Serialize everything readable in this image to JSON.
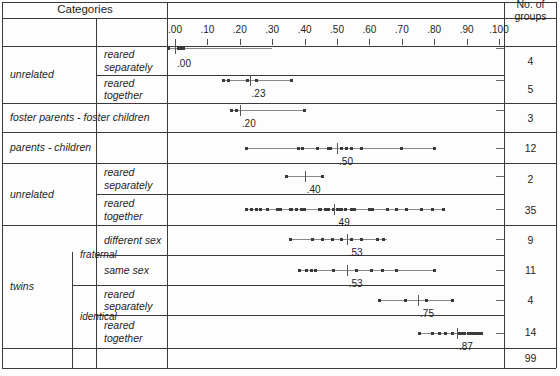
{
  "chart_data": {
    "type": "scatter",
    "title": "",
    "xlabel": "",
    "ylabel": "",
    "xlim": [
      -0.03,
      1.06
    ],
    "grid": false,
    "legend": null,
    "axis_ticks": [
      {
        "label": ".00",
        "value": 0.0
      },
      {
        "label": ".10",
        "value": 0.1
      },
      {
        "label": ".20",
        "value": 0.2
      },
      {
        "label": ".30",
        "value": 0.3
      },
      {
        "label": ".40",
        "value": 0.4
      },
      {
        "label": ".50",
        "value": 0.5
      },
      {
        "label": ".60",
        "value": 0.6
      },
      {
        "label": ".70",
        "value": 0.7
      },
      {
        "label": ".80",
        "value": 0.8
      },
      {
        "label": ".90",
        "value": 0.9
      },
      {
        "label": ".100",
        "value": 1.0
      }
    ],
    "rows": [
      {
        "category": "unrelated / reared separately",
        "groups": 4,
        "mean": 0.0,
        "mean_label": ".00",
        "range": [
          -0.02,
          0.3
        ],
        "values": [
          -0.02,
          0.01,
          0.02,
          0.025
        ]
      },
      {
        "category": "unrelated / reared together",
        "groups": 5,
        "mean": 0.23,
        "mean_label": ".23",
        "range": [
          0.15,
          0.36
        ],
        "values": [
          0.15,
          0.165,
          0.225,
          0.25,
          0.36
        ]
      },
      {
        "category": "foster parents - foster children",
        "groups": 3,
        "mean": 0.2,
        "mean_label": ".20",
        "range": [
          0.175,
          0.4
        ],
        "values": [
          0.175,
          0.19,
          0.4
        ]
      },
      {
        "category": "parents - children",
        "groups": 12,
        "mean": 0.5,
        "mean_label": ".50",
        "range": [
          0.22,
          0.8
        ],
        "values": [
          0.22,
          0.38,
          0.395,
          0.44,
          0.475,
          0.48,
          0.515,
          0.53,
          0.545,
          0.575,
          0.7,
          0.8
        ]
      },
      {
        "category": "unrelated / reared separately (2)",
        "groups": 2,
        "mean": 0.4,
        "mean_label": ".40",
        "range": [
          0.345,
          0.455
        ],
        "values": [
          0.345,
          0.455
        ]
      },
      {
        "category": "unrelated / reared together (2)",
        "groups": 35,
        "mean": 0.49,
        "mean_label": ".49",
        "range": [
          0.22,
          0.83
        ],
        "values": [
          0.22,
          0.235,
          0.25,
          0.265,
          0.285,
          0.315,
          0.325,
          0.355,
          0.36,
          0.36,
          0.36,
          0.375,
          0.39,
          0.4,
          0.445,
          0.45,
          0.45,
          0.465,
          0.475,
          0.49,
          0.5,
          0.505,
          0.515,
          0.515,
          0.525,
          0.545,
          0.555,
          0.6,
          0.61,
          0.655,
          0.685,
          0.715,
          0.76,
          0.795,
          0.83
        ]
      },
      {
        "category": "twins / fraternal / different sex",
        "groups": 9,
        "mean": 0.53,
        "mean_label": ".53",
        "range": [
          0.355,
          0.655
        ],
        "values": [
          0.355,
          0.425,
          0.455,
          0.485,
          0.515,
          0.545,
          0.575,
          0.625,
          0.645
        ]
      },
      {
        "category": "twins / fraternal / same sex",
        "groups": 11,
        "mean": 0.53,
        "mean_label": ".53",
        "range": [
          0.385,
          0.8
        ],
        "values": [
          0.385,
          0.405,
          0.42,
          0.435,
          0.49,
          0.49,
          0.56,
          0.605,
          0.64,
          0.685,
          0.8
        ]
      },
      {
        "category": "twins / identical / reared separately",
        "groups": 4,
        "mean": 0.75,
        "mean_label": ".75",
        "range": [
          0.63,
          0.855
        ],
        "values": [
          0.63,
          0.71,
          0.775,
          0.855
        ]
      },
      {
        "category": "twins / identical / reared together",
        "groups": 14,
        "mean": 0.87,
        "mean_label": ".87",
        "range": [
          0.755,
          0.945
        ],
        "values": [
          0.755,
          0.795,
          0.815,
          0.835,
          0.855,
          0.875,
          0.885,
          0.895,
          0.905,
          0.915,
          0.925,
          0.93,
          0.94,
          0.945
        ]
      }
    ]
  },
  "table": {
    "header": "Categories",
    "rows": [
      {
        "level1": "unrelated",
        "level2": "",
        "level3": "reared\nseparately",
        "groups": "4"
      },
      {
        "level1": "",
        "level2": "",
        "level3": "reared\ntogether",
        "groups": "5"
      },
      {
        "level1": "foster parents - foster children",
        "level2": "",
        "level3": "",
        "groups": "3"
      },
      {
        "level1": "parents - children",
        "level2": "",
        "level3": "",
        "groups": "12"
      },
      {
        "level1": "unrelated",
        "level2": "",
        "level3": "reared\nseparately",
        "groups": "2"
      },
      {
        "level1": "",
        "level2": "",
        "level3": "reared\ntogether",
        "groups": "35"
      },
      {
        "level1": "twins",
        "level2": "fraternal",
        "level3": "different sex",
        "groups": "9"
      },
      {
        "level1": "",
        "level2": "",
        "level3": "same sex",
        "groups": "11"
      },
      {
        "level1": "",
        "level2": "identical",
        "level3": "reared\nseparately",
        "groups": "4"
      },
      {
        "level1": "",
        "level2": "",
        "level3": "reared\ntogether",
        "groups": "14"
      }
    ],
    "labels": {
      "unrelated_1": "unrelated",
      "reared_separately_1": "reared",
      "reared_separately_1b": "separately",
      "reared_together_1": "reared",
      "reared_together_1b": "together",
      "foster": "foster parents - foster children",
      "parents_children": "parents - children",
      "unrelated_2": "unrelated",
      "reared_separately_2": "reared",
      "reared_separately_2b": "separately",
      "reared_together_2": "reared",
      "reared_together_2b": "together",
      "twins": "twins",
      "fraternal": "fraternal",
      "different_sex": "different sex",
      "same_sex": "same sex",
      "identical": "identical",
      "reared_separately_3": "reared",
      "reared_separately_3b": "separately",
      "reared_together_3": "reared",
      "reared_together_3b": "together"
    }
  },
  "groups_column": {
    "header_line1": "No. of",
    "header_line2": "groups",
    "values": [
      "4",
      "5",
      "3",
      "12",
      "2",
      "35",
      "9",
      "11",
      "4",
      "14"
    ],
    "total": "99"
  },
  "colors": {
    "border": "#3a3a3a",
    "dot": "#3a3a3a",
    "range_line": "#8a8a8a",
    "text": "#1d1d1d",
    "background": "#fdfdfd"
  }
}
